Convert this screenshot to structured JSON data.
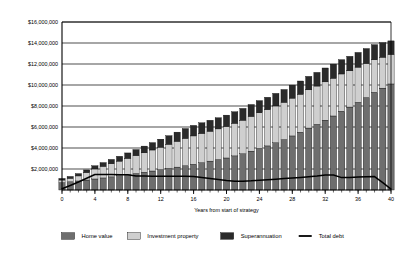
{
  "chart_data": {
    "type": "bar",
    "stacked": true,
    "title": "",
    "xlabel": "Years from start of strategy",
    "ylabel": "",
    "grid": true,
    "legend_position": "bottom",
    "xlim": [
      0,
      40
    ],
    "ylim": [
      0,
      16000000
    ],
    "ytick_labels": [
      "$16,000,000",
      "$14,000,000",
      "$12,000,000",
      "$10,000,000",
      "$8,000,000",
      "$6,000,000",
      "$4,000,000",
      "$2,000,000"
    ],
    "ytick_values": [
      16000000,
      14000000,
      12000000,
      10000000,
      8000000,
      6000000,
      4000000,
      2000000
    ],
    "xtick_labels": [
      "0",
      "4",
      "8",
      "12",
      "16",
      "20",
      "24",
      "28",
      "32",
      "36",
      "40"
    ],
    "xtick_values": [
      0,
      4,
      8,
      12,
      16,
      20,
      24,
      28,
      32,
      36,
      40
    ],
    "categories": [
      0,
      1,
      2,
      3,
      4,
      5,
      6,
      7,
      8,
      9,
      10,
      11,
      12,
      13,
      14,
      15,
      16,
      17,
      18,
      19,
      20,
      21,
      22,
      23,
      24,
      25,
      26,
      27,
      28,
      29,
      30,
      31,
      32,
      33,
      34,
      35,
      36,
      37,
      38,
      39,
      40
    ],
    "series": [
      {
        "name": "Home value",
        "color": "#6e6e6e",
        "values": [
          700000,
          780000,
          860000,
          950000,
          1050000,
          1150000,
          1250000,
          1350000,
          1460000,
          1570000,
          1690000,
          1810000,
          1930000,
          2050000,
          2180000,
          2310000,
          2450000,
          2600000,
          2750000,
          2900000,
          3050000,
          3250000,
          3450000,
          3700000,
          3950000,
          4200000,
          4500000,
          4800000,
          5150000,
          5500000,
          5900000,
          6250000,
          6650000,
          7050000,
          7500000,
          7900000,
          8350000,
          8800000,
          9300000,
          9700000,
          10100000
        ]
      },
      {
        "name": "Investment property",
        "color": "#cfcfcf",
        "values": [
          250000,
          330000,
          480000,
          700000,
          950000,
          1100000,
          1250000,
          1400000,
          1550000,
          1700000,
          1850000,
          2000000,
          2150000,
          2300000,
          2450000,
          2600000,
          2700000,
          2780000,
          2850000,
          2920000,
          3000000,
          3100000,
          3200000,
          3300000,
          3400000,
          3450000,
          3500000,
          3550000,
          3600000,
          3620000,
          3640000,
          3650000,
          3650000,
          3600000,
          3550000,
          3450000,
          3350000,
          3250000,
          3100000,
          2950000,
          2800000
        ]
      },
      {
        "name": "Superannuation",
        "color": "#2a2a2a",
        "values": [
          150000,
          180000,
          220000,
          260000,
          310000,
          360000,
          410000,
          460000,
          520000,
          580000,
          640000,
          700000,
          760000,
          820000,
          880000,
          940000,
          1000000,
          1020000,
          1040000,
          1060000,
          1080000,
          1100000,
          1120000,
          1140000,
          1160000,
          1180000,
          1200000,
          1220000,
          1240000,
          1260000,
          1280000,
          1300000,
          1320000,
          1340000,
          1360000,
          1380000,
          1400000,
          1420000,
          1440000,
          1380000,
          1300000
        ]
      }
    ],
    "line_series": {
      "name": "Total debt",
      "color": "#000000",
      "values": [
        120000,
        430000,
        760000,
        1120000,
        1480000,
        1480000,
        1470000,
        1460000,
        1450000,
        1340000,
        1330000,
        1320000,
        1310000,
        1310000,
        1300000,
        1300000,
        1280000,
        1200000,
        1100000,
        1000000,
        900000,
        830000,
        830000,
        870000,
        930000,
        980000,
        1030000,
        1090000,
        1140000,
        1200000,
        1260000,
        1330000,
        1420000,
        1420000,
        1180000,
        1200000,
        1230000,
        1260000,
        1280000,
        700000,
        90000
      ]
    },
    "legend": [
      {
        "label": "Home value",
        "marker": "swatch",
        "color": "#6e6e6e"
      },
      {
        "label": "Investment property",
        "marker": "swatch",
        "color": "#cfcfcf"
      },
      {
        "label": "Superannuation",
        "marker": "swatch",
        "color": "#2a2a2a"
      },
      {
        "label": "Total debt",
        "marker": "line",
        "color": "#000000"
      }
    ]
  }
}
